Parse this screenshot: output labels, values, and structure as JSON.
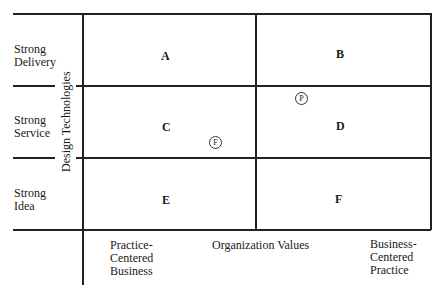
{
  "diagram": {
    "type": "2x3 matrix",
    "y_axis_label": "Design Technologies",
    "x_axis_label": "Organization Values",
    "rows": [
      {
        "label": "Strong Delivery",
        "line1": "Strong",
        "line2": "Delivery"
      },
      {
        "label": "Strong Service",
        "line1": "Strong",
        "line2": "Service"
      },
      {
        "label": "Strong Idea",
        "line1": "Strong",
        "line2": "Idea"
      }
    ],
    "columns": [
      {
        "label": "Practice-Centered Business",
        "line1": "Practice-",
        "line2": "Centered",
        "line3": "Business"
      },
      {
        "label": "Business-Centered Practice",
        "line1": "Business-",
        "line2": "Centered",
        "line3": "Practice"
      }
    ],
    "cells": [
      "A",
      "B",
      "C",
      "D",
      "E",
      "F"
    ],
    "markers": [
      {
        "symbol": "F",
        "position": "lower right of C near D boundary"
      },
      {
        "symbol": "P",
        "position": "upper left of D"
      }
    ]
  }
}
